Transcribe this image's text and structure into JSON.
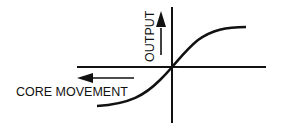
{
  "diagram": {
    "type": "transfer-curve",
    "labels": {
      "x_axis": "CORE MOVEMENT",
      "y_axis": "OUTPUT"
    },
    "curve": "sigmoid through origin (S-shaped)",
    "colors": {
      "ink": "#111111",
      "background": "#ffffff"
    }
  }
}
